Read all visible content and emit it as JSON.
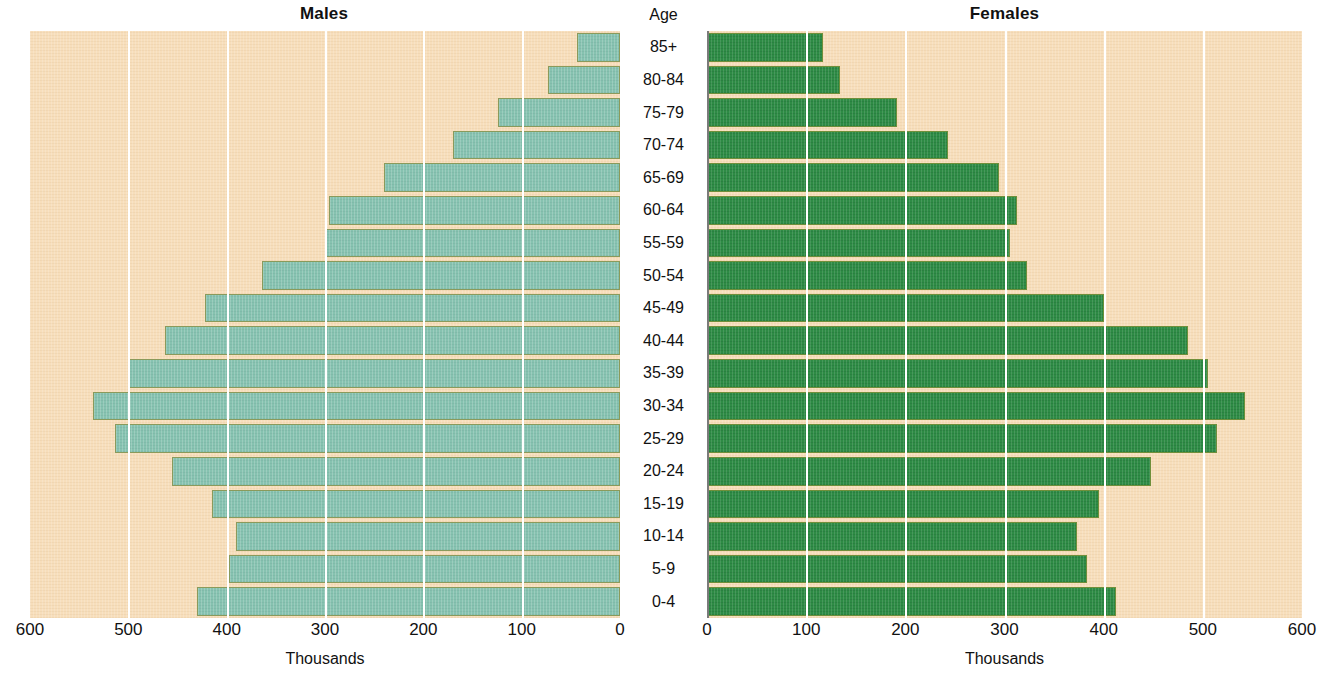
{
  "titles": {
    "males": "Males",
    "females": "Females",
    "age": "Age"
  },
  "axis_caption": {
    "males": "Thousands",
    "females": "Thousands"
  },
  "chart_data": {
    "type": "bar",
    "subtype": "population-pyramid",
    "title": "",
    "xlabel": "Thousands",
    "ylabel": "Age",
    "grid": true,
    "legend_position": "none",
    "categories": [
      "85+",
      "80-84",
      "75-79",
      "70-74",
      "65-69",
      "60-64",
      "55-59",
      "50-54",
      "45-49",
      "40-44",
      "35-39",
      "30-34",
      "25-29",
      "20-24",
      "15-19",
      "10-14",
      "5-9",
      "0-4"
    ],
    "left_axis": {
      "label": "Males",
      "ticks": [
        600,
        500,
        400,
        300,
        200,
        100,
        0
      ],
      "tick_labels": [
        "600",
        "500",
        "400",
        "300",
        "200",
        "100",
        "0"
      ],
      "range": [
        600,
        0
      ],
      "reversed": true,
      "color": "#86c2b0"
    },
    "right_axis": {
      "label": "Females",
      "ticks": [
        0,
        100,
        200,
        300,
        400,
        500,
        600
      ],
      "tick_labels": [
        "0",
        "100",
        "200",
        "300",
        "400",
        "500",
        "600"
      ],
      "range": [
        0,
        600
      ],
      "reversed": false,
      "color": "#2e8b45"
    },
    "series": [
      {
        "name": "Males",
        "units": "thousands",
        "values": [
          44,
          73,
          124,
          170,
          240,
          296,
          300,
          364,
          422,
          463,
          500,
          536,
          514,
          456,
          415,
          391,
          398,
          430
        ]
      },
      {
        "name": "Females",
        "units": "thousands",
        "values": [
          117,
          134,
          192,
          243,
          294,
          313,
          306,
          323,
          400,
          485,
          505,
          543,
          514,
          448,
          395,
          373,
          383,
          412
        ]
      }
    ]
  },
  "colors": {
    "plot_background": "#f7debb",
    "male_bar": "#86c2b0",
    "female_bar": "#2e8b45",
    "gridline": "#ffffff",
    "axis_line": "#7a7a7a",
    "text": "#111111"
  }
}
